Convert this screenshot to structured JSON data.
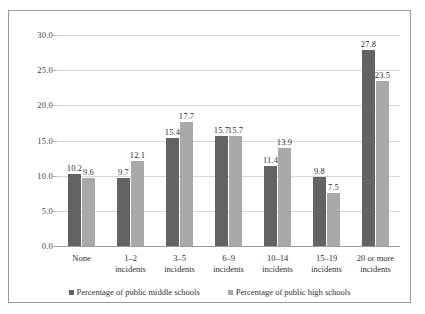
{
  "chart_data": {
    "type": "bar",
    "title": "",
    "subtitle": "",
    "xlabel": "",
    "ylabel": "",
    "ylim": [
      0.0,
      30.0
    ],
    "yticks": [
      "0.0",
      "5.0",
      "10.0",
      "15.0",
      "20.0",
      "25.0",
      "30.0"
    ],
    "ytick_values": [
      0.0,
      5.0,
      10.0,
      15.0,
      20.0,
      25.0,
      30.0
    ],
    "grid": true,
    "legend_position": "bottom",
    "categories": [
      "None",
      "1–2 incidents",
      "3–5 incidents",
      "6–9 incidents",
      "10–14 incidents",
      "15–19 incidents",
      "20 or more incidents"
    ],
    "category_lines": [
      [
        "None",
        ""
      ],
      [
        "1–2",
        "incidents"
      ],
      [
        "3–5",
        "incidents"
      ],
      [
        "6–9",
        "incidents"
      ],
      [
        "10–14",
        "incidents"
      ],
      [
        "15–19",
        "incidents"
      ],
      [
        "20 or more",
        "incidents"
      ]
    ],
    "series": [
      {
        "name": "Percentage of public middle schools",
        "color": "#636363",
        "values": [
          10.2,
          9.7,
          15.4,
          15.7,
          11.4,
          9.8,
          27.8
        ],
        "labels": [
          "10.2",
          "9.7",
          "15.4",
          "15.7",
          "11.4",
          "9.8",
          "27.8"
        ]
      },
      {
        "name": "Percentage of public high schools",
        "color": "#a9a9a9",
        "values": [
          9.6,
          12.1,
          17.7,
          15.7,
          13.9,
          7.5,
          23.5
        ],
        "labels": [
          "9.6",
          "12.1",
          "17.7",
          "15.7",
          "13.9",
          "7.5",
          "23.5"
        ]
      }
    ]
  },
  "colors": {
    "series_middle_schools": "#636363",
    "series_high_schools": "#a9a9a9",
    "gridline": "#d6d6d6",
    "axis": "#9a9a9a",
    "frame": "#9a9a9a",
    "text": "#2f2f2f",
    "background": "#ffffff"
  }
}
